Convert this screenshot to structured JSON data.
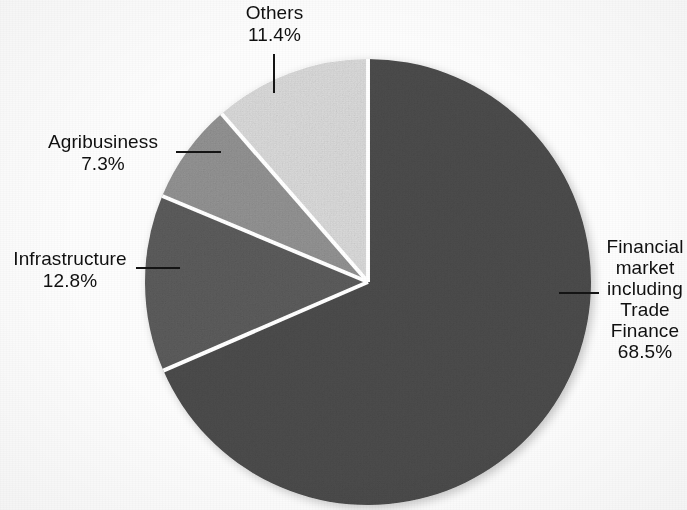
{
  "chart_data": {
    "type": "pie",
    "title": "",
    "categories": [
      "Financial market including Trade Finance",
      "Infrastructure",
      "Agribusiness",
      "Others"
    ],
    "values": [
      68.5,
      12.8,
      7.3,
      11.4
    ],
    "value_labels": [
      "68.5%",
      "12.8%",
      "7.3%",
      "11.4%"
    ],
    "units": "percent",
    "start_angle_deg": 0,
    "direction": "clockwise",
    "legend": "none",
    "grid": false,
    "slices": [
      {
        "name": "Financial market including Trade Finance",
        "name_lines": [
          "Financial",
          "market",
          "including",
          "Trade",
          "Finance"
        ],
        "value": 68.5,
        "value_label": "68.5%",
        "color": "#4d4d4d",
        "start_deg": 0,
        "end_deg": 246.6
      },
      {
        "name": "Infrastructure",
        "name_lines": [
          "Infrastructure"
        ],
        "value": 12.8,
        "value_label": "12.8%",
        "color": "#5d5d5d",
        "start_deg": 246.6,
        "end_deg": 292.68
      },
      {
        "name": "Agribusiness",
        "name_lines": [
          "Agribusiness"
        ],
        "value": 7.3,
        "value_label": "7.3%",
        "color": "#949494",
        "start_deg": 292.68,
        "end_deg": 318.96
      },
      {
        "name": "Others",
        "name_lines": [
          "Others"
        ],
        "value": 11.4,
        "value_label": "11.4%",
        "color": "#dcdcdc",
        "start_deg": 318.96,
        "end_deg": 360
      }
    ]
  },
  "labels": {
    "others": {
      "name": "Others",
      "value": "11.4%"
    },
    "agribusiness": {
      "name": "Agribusiness",
      "value": "7.3%"
    },
    "infrastructure": {
      "name": "Infrastructure",
      "value": "12.8%"
    },
    "financial": {
      "name": "Financial market including Trade Finance",
      "value": "68.5%"
    }
  },
  "colors": {
    "financial": "#4d4d4d",
    "infrastructure": "#5d5d5d",
    "agribusiness": "#949494",
    "others": "#dcdcdc",
    "separator": "#ffffff",
    "text": "#101010",
    "background": "#fdfdfd"
  }
}
